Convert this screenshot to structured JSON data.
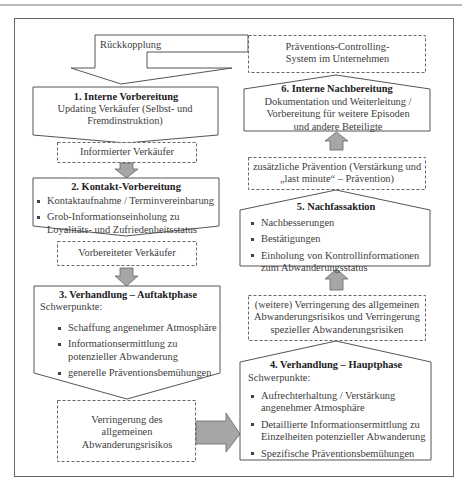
{
  "diagram": {
    "feedback_label": "Rückkopplung",
    "controlling_box": "Präventions-Controlling-System im Unternehmen",
    "left_column": {
      "step1": {
        "title": "1. Interne Vorbereitung",
        "text": "Updating Verkäufer (Selbst- und Fremdinstruktion)"
      },
      "result1": "Informierter Verkäufer",
      "step2": {
        "title": "2. Kontakt-Vorbereitung",
        "bullets": [
          "Kontaktaufnahme / Terminvereinbarung",
          "Grob-Informationseinholung zu Loyalitäts- und Zufriedenheitsstatus"
        ]
      },
      "result2": "Vorbereiteter Verkäufer",
      "step3": {
        "title": "3. Verhandlung – Auftaktphase",
        "subtitle": "Schwerpunkte:",
        "bullets": [
          "Schaffung angenehmer Atmosphäre",
          "Informationsermittlung zu potenzieller Abwanderung",
          "generelle Präventionsbemühungen"
        ]
      },
      "result3": "Verringerung des allgemeinen Abwanderungsrisikos"
    },
    "right_column": {
      "step4": {
        "title": "4. Verhandlung – Hauptphase",
        "subtitle": "Schwerpunkte:",
        "bullets": [
          "Aufrechterhaltung / Verstärkung angenehmer Atmosphäre",
          "Detaillierte Informationsermittlung zu Einzelheiten potenzieller Abwanderung",
          "Spezifische Präventionsbemühungen"
        ]
      },
      "result4": "(weitere) Verringerung des allgemeinen Abwanderungsrisikos und Verringerung spezieller Abwanderungsrisiken",
      "step5": {
        "title": "5. Nachfassaktion",
        "bullets": [
          "Nachbesserungen",
          "Bestätigungen",
          "Einholung von Kontrollinformationen zum Abwanderungsstatus"
        ]
      },
      "result5": "zusätzliche Prävention (Verstärkung und „last minute“ – Prävention)",
      "step6": {
        "title": "6. Interne Nachbereitung",
        "text": "Dokumentation und Weiterleitung / Vorbereitung für weitere Episoden und andere Beteiligte"
      }
    },
    "colors": {
      "line": "#555555",
      "arrow_fill": "#a6a6a6",
      "frame": "#666666"
    }
  }
}
